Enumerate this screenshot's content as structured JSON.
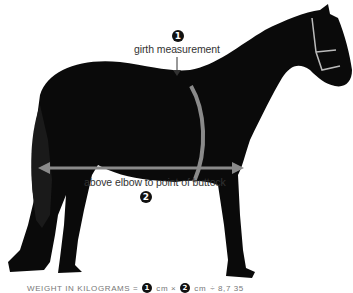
{
  "diagram": {
    "colors": {
      "horse": "#0a0a0a",
      "arrow": "#7a7a7a",
      "text": "#333333",
      "badge": "#111111"
    },
    "measurements": [
      {
        "number": "1",
        "label": "girth measurement"
      },
      {
        "number": "2",
        "label": "above elbow to point of buttock"
      }
    ],
    "formula": {
      "prefix": "WEIGHT IN KILOGRAMS =",
      "term1_badge": "1",
      "term1_unit": "cm ×",
      "term2_badge": "2",
      "term2_unit": "cm",
      "suffix": "÷ 8,7 35"
    }
  }
}
